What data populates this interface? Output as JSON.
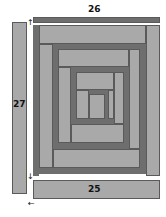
{
  "diagram": {
    "type": "log-cabin quilt block assembly",
    "strips": {
      "top": {
        "label": "26"
      },
      "left": {
        "label": "27"
      },
      "bottom": {
        "label": "25"
      }
    },
    "arrows": [
      {
        "name": "up-arrow",
        "glyph": "↑"
      },
      {
        "name": "down-arrow",
        "glyph": "↓"
      },
      {
        "name": "left-arrow",
        "glyph": "←"
      }
    ],
    "colors": {
      "light": "#a9a9a9",
      "dark": "#6e6e6e",
      "background": "#ffffff"
    }
  }
}
